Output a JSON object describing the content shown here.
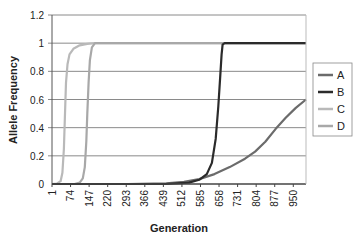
{
  "chart_data": {
    "type": "line",
    "title": "",
    "xlabel": "Generation",
    "ylabel": "Allele Frequency",
    "xlim": [
      1,
      1000
    ],
    "ylim": [
      0,
      1.2
    ],
    "x_tick_labels": [
      "1",
      "74",
      "147",
      "220",
      "293",
      "366",
      "439",
      "512",
      "585",
      "658",
      "731",
      "804",
      "877",
      "950"
    ],
    "y_tick_labels": [
      "0",
      "0.2",
      "0.4",
      "0.6",
      "0.8",
      "1",
      "1.2"
    ],
    "y_ticks": [
      0,
      0.2,
      0.4,
      0.6,
      0.8,
      1.0,
      1.2
    ],
    "grid": "horizontal",
    "legend_position": "right",
    "series": [
      {
        "name": "A",
        "color": "#6b6b6b",
        "x": [
          1,
          300,
          450,
          520,
          580,
          640,
          700,
          760,
          800,
          840,
          880,
          920,
          960,
          1000
        ],
        "y": [
          0,
          0,
          0.005,
          0.015,
          0.035,
          0.07,
          0.12,
          0.18,
          0.23,
          0.3,
          0.39,
          0.47,
          0.54,
          0.6
        ]
      },
      {
        "name": "B",
        "color": "#2b2b2b",
        "x": [
          1,
          450,
          540,
          580,
          610,
          630,
          645,
          655,
          662,
          668,
          672,
          680,
          1000
        ],
        "y": [
          0,
          0,
          0.01,
          0.03,
          0.07,
          0.15,
          0.32,
          0.55,
          0.75,
          0.92,
          0.99,
          1.0,
          1.0
        ]
      },
      {
        "name": "C",
        "color": "#b9b9b9",
        "x": [
          1,
          20,
          35,
          42,
          48,
          52,
          56,
          62,
          70,
          85,
          110,
          140,
          170,
          1000
        ],
        "y": [
          0,
          0.002,
          0.02,
          0.08,
          0.25,
          0.5,
          0.72,
          0.85,
          0.92,
          0.96,
          0.985,
          0.995,
          1.0,
          1.0
        ]
      },
      {
        "name": "D",
        "color": "#a8a8a8",
        "x": [
          1,
          90,
          110,
          122,
          130,
          136,
          140,
          145,
          150,
          158,
          170,
          1000
        ],
        "y": [
          0,
          0,
          0.01,
          0.04,
          0.12,
          0.3,
          0.5,
          0.72,
          0.88,
          0.97,
          1.0,
          1.0
        ]
      }
    ]
  },
  "legend": {
    "items": [
      {
        "label": "A",
        "color": "#6b6b6b"
      },
      {
        "label": "B",
        "color": "#2b2b2b"
      },
      {
        "label": "C",
        "color": "#b9b9b9"
      },
      {
        "label": "D",
        "color": "#a8a8a8"
      }
    ]
  }
}
